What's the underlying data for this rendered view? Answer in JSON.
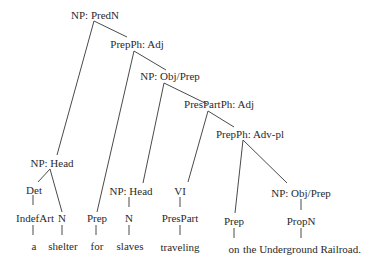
{
  "diagram": {
    "type": "syntax-tree",
    "nodes": {
      "np_predn": "NP: PredN",
      "prepph_adj": "PrepPh: Adj",
      "np_obj_prep_1": "NP: Obj/Prep",
      "prespartph_adj": "PresPartPh: Adj",
      "prepph_advpl": "PrepPh: Adv-pl",
      "np_head_1": "NP: Head",
      "det": "Det",
      "indefart": "IndefArt",
      "n_1": "N",
      "word_a": "a",
      "word_shelter": "shelter",
      "prep_1": "Prep",
      "word_for": "for",
      "np_head_2": "NP: Head",
      "n_2": "N",
      "word_slaves": "slaves",
      "vi": "VI",
      "prespart": "PresPart",
      "word_traveling": "traveling",
      "prep_2": "Prep",
      "word_on": "on",
      "np_obj_prep_2": "NP: Obj/Prep",
      "propn": "PropN",
      "word_railroad": "the Underground Railroad."
    }
  }
}
